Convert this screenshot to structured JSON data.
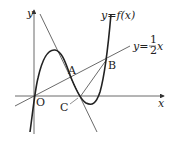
{
  "diagram": {
    "curve_label": "y=f(x)",
    "line_label_prefix": "y=",
    "line_label_num": "1",
    "line_label_den": "2",
    "line_label_var": "x",
    "axis_x": "x",
    "axis_y": "y",
    "points": {
      "O": "O",
      "A": "A",
      "B": "B",
      "C": "C"
    }
  }
}
